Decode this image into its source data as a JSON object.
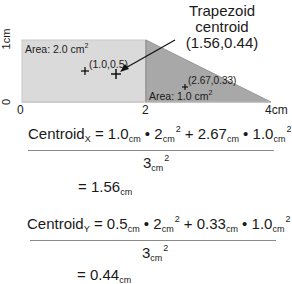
{
  "diagram": {
    "y_axis": {
      "label_top": "1cm",
      "label_bottom": "0"
    },
    "x_axis": {
      "ticks": [
        "0",
        "2",
        "4cm"
      ]
    },
    "rectangle": {
      "area_label": "Area: 2.0 cm",
      "area_sup": "2",
      "centroid_label": "(1.0,0.5)",
      "fill": "#d9d9d9"
    },
    "triangle": {
      "area_label": "Area: 1.0 cm",
      "area_sup": "2",
      "centroid_label": "(2.67,0.33)",
      "fill": "#a6a6a6"
    },
    "trapezoid": {
      "title_line1": "Trapezoid",
      "title_line2": "centroid",
      "title_line3": "(1.56,0.44)"
    }
  },
  "equations": {
    "x": {
      "lhs": "Centroid",
      "axis_sub": "X",
      "eq": " = ",
      "t1": "1.0",
      "u1": "cm",
      "dot1": " • ",
      "t2": "2",
      "u2": "cm",
      "s2": "2",
      "plus": " + ",
      "t3": "2.67",
      "u3": "cm",
      "dot2": " • ",
      "t4": "1.0",
      "u4": "cm",
      "s4": "2",
      "den": "3",
      "den_unit": "cm",
      "den_sup": "2",
      "result": "= 1.56",
      "result_unit": "cm"
    },
    "y": {
      "lhs": "Centroid",
      "axis_sub": "Y",
      "eq": " = ",
      "t1": "0.5",
      "u1": "cm",
      "dot1": " • ",
      "t2": "2",
      "u2": "cm",
      "s2": "2",
      "plus": " + ",
      "t3": "0.33",
      "u3": "cm",
      "dot2": " • ",
      "t4": "1.0",
      "u4": "cm",
      "s4": "2",
      "den": "3",
      "den_unit": "cm",
      "den_sup": "2",
      "result": "= 0.44",
      "result_unit": "cm"
    }
  }
}
